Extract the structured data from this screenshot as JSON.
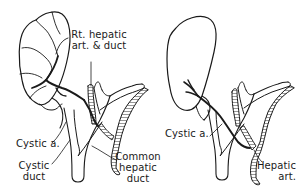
{
  "figure": {
    "type": "anatomical line drawing",
    "colors": {
      "line": "#1a1a1a",
      "background": "#ffffff"
    },
    "panels": [
      {
        "id": "left",
        "labels": {
          "rt_hepatic": [
            "Rt. hepatic",
            "art. & duct"
          ],
          "cystic_artery": "Cystic a.",
          "cystic_duct": [
            "Cystic",
            "duct"
          ],
          "common_hepatic_duct": [
            "Common",
            "hepatic",
            "duct"
          ]
        }
      },
      {
        "id": "right",
        "labels": {
          "cystic_artery": "Cystic a.",
          "hepatic_artery": [
            "Hepatic",
            "art."
          ]
        }
      }
    ]
  }
}
